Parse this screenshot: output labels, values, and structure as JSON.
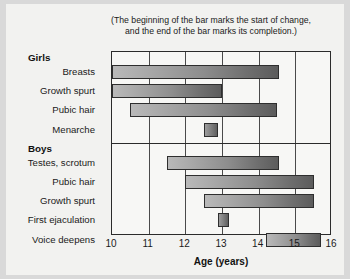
{
  "figure": {
    "caption_line_1": "(The beginning of the bar marks the start of change,",
    "caption_line_2": "and the end of the bar marks its completion.)",
    "background_color": "#f2f2f0",
    "frame_color": "#2b2b2b"
  },
  "chart_data": {
    "type": "bar",
    "orientation": "horizontal",
    "subtype": "range-bar",
    "title": "(The beginning of the bar marks the start of change, and the end of the bar marks its completion.)",
    "xlabel": "Age (years)",
    "ylabel": "",
    "xlim": [
      10,
      16
    ],
    "xticks": [
      10,
      11,
      12,
      13,
      14,
      15,
      16
    ],
    "xtick_labels": [
      "10",
      "11",
      "12",
      "13",
      "14",
      "15",
      "16"
    ],
    "grid": true,
    "legend": "none",
    "groups": [
      {
        "name": "Girls",
        "categories": [
          "Breasts",
          "Growth spurt",
          "Pubic hair",
          "Menarche"
        ],
        "ranges": [
          [
            10.0,
            14.55
          ],
          [
            10.0,
            13.0
          ],
          [
            10.5,
            14.5
          ],
          [
            12.5,
            12.9
          ]
        ]
      },
      {
        "name": "Boys",
        "categories": [
          "Testes, scrotum",
          "Pubic hair",
          "Growth spurt",
          "First ejaculation",
          "Voice deepens"
        ],
        "ranges": [
          [
            11.5,
            14.55
          ],
          [
            12.0,
            15.5
          ],
          [
            12.5,
            15.5
          ],
          [
            12.9,
            13.2
          ],
          [
            14.2,
            15.7
          ]
        ]
      }
    ],
    "bar_color_start": "#b9b9b9",
    "bar_color_end": "#5c5c5c"
  }
}
